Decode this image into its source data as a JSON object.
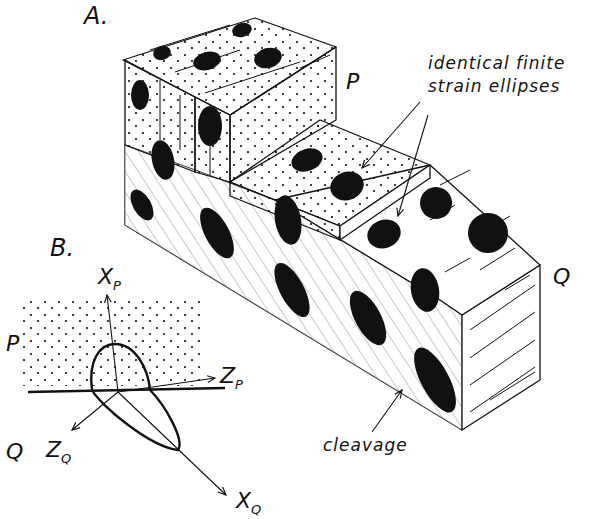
{
  "figure": {
    "panel_a_label": "A.",
    "panel_b_label": "B.",
    "panel_a": {
      "unit_p_label": "P",
      "unit_q_label": "Q",
      "annotation_ellipses_line1": "identical finite",
      "annotation_ellipses_line2": "strain ellipses",
      "annotation_cleavage": "cleavage"
    },
    "panel_b": {
      "unit_p_label": "P",
      "unit_q_label": "Q",
      "axes": {
        "xp": {
          "main": "X",
          "sub": "P"
        },
        "zp": {
          "main": "Z",
          "sub": "P"
        },
        "zq": {
          "main": "Z",
          "sub": "Q"
        },
        "xq": {
          "main": "X",
          "sub": "Q"
        }
      }
    }
  }
}
